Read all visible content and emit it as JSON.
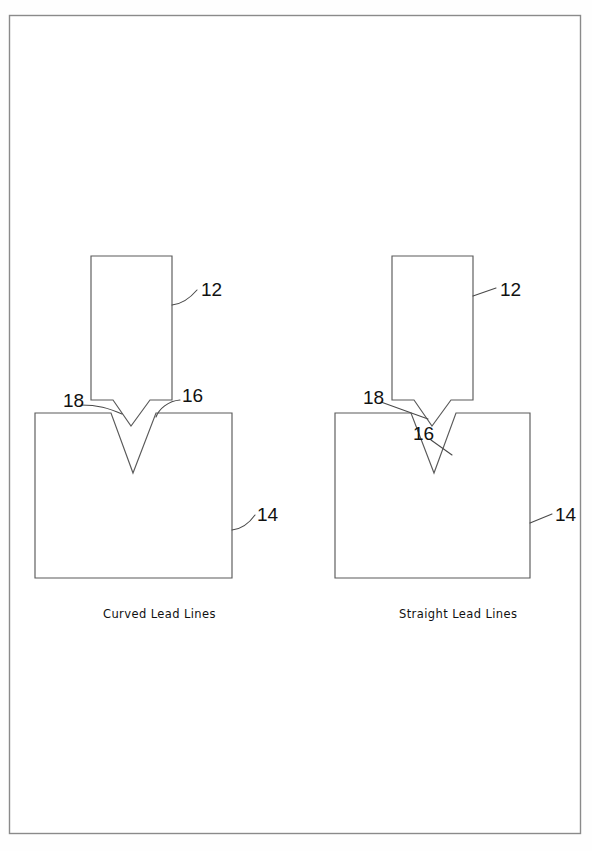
{
  "page": {
    "background_color": "#fefefe",
    "border_color": "#8a8a8a",
    "line_color": "#5a5a5a",
    "text_color": "#111111"
  },
  "figures": [
    {
      "id": "figure-left",
      "caption": "Curved Lead Lines",
      "lead_line_style": "curved",
      "labels": [
        {
          "name": "reference-numeral-12",
          "text": "12",
          "x": 201,
          "y": 296
        },
        {
          "name": "reference-numeral-18",
          "text": "18",
          "x": 63,
          "y": 407
        },
        {
          "name": "reference-numeral-16",
          "text": "16",
          "x": 182,
          "y": 402
        },
        {
          "name": "reference-numeral-14",
          "text": "14",
          "x": 257,
          "y": 521
        }
      ]
    },
    {
      "id": "figure-right",
      "caption": "Straight Lead Lines",
      "lead_line_style": "straight",
      "labels": [
        {
          "name": "reference-numeral-12",
          "text": "12",
          "x": 500,
          "y": 296
        },
        {
          "name": "reference-numeral-18",
          "text": "18",
          "x": 363,
          "y": 404
        },
        {
          "name": "reference-numeral-16",
          "text": "16",
          "x": 413,
          "y": 440
        },
        {
          "name": "reference-numeral-14",
          "text": "14",
          "x": 555,
          "y": 521
        }
      ]
    }
  ],
  "parts": {
    "punch_label": "12",
    "workpiece_label": "14",
    "groove_label": "16",
    "tip_label": "18"
  }
}
